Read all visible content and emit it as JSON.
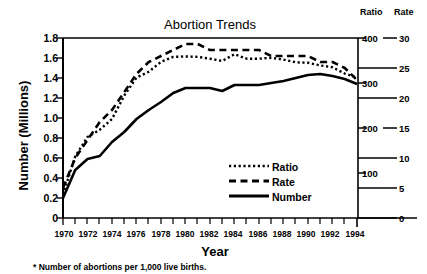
{
  "chart_data": {
    "type": "line",
    "title": "Abortion Trends",
    "xlabel": "Year",
    "ylabel": "Number (Millions)",
    "footnote": "* Number of abortions per 1,000 live births.",
    "grid": false,
    "legend_position": "inside-right-lower",
    "x": [
      1970,
      1971,
      1972,
      1973,
      1974,
      1975,
      1976,
      1977,
      1978,
      1979,
      1980,
      1981,
      1982,
      1983,
      1984,
      1985,
      1986,
      1987,
      1988,
      1989,
      1990,
      1991,
      1992,
      1993,
      1994
    ],
    "xlim": [
      1970,
      1994
    ],
    "xtick_labels": [
      "1970",
      "1972",
      "1974",
      "1976",
      "1978",
      "1980",
      "1982",
      "1984",
      "1986",
      "1988",
      "1990",
      "1992",
      "1994"
    ],
    "axes": [
      {
        "name": "left",
        "title": "Number (Millions)",
        "ylim": [
          0,
          1.8
        ],
        "ticks": [
          "1.8",
          "1.6",
          "1.4",
          "1.2",
          "1.0",
          "0.8",
          "0.6",
          "0.4",
          "0.2",
          "0"
        ],
        "tick_values": [
          1.8,
          1.6,
          1.4,
          1.2,
          1.0,
          0.8,
          0.6,
          0.4,
          0.2,
          0
        ]
      },
      {
        "name": "ratio",
        "title": "Ratio",
        "ylim": [
          0,
          400
        ],
        "ticks": [
          "400",
          "300",
          "200",
          "100"
        ],
        "tick_values": [
          400,
          300,
          200,
          100
        ]
      },
      {
        "name": "rate",
        "title": "Rate",
        "ylim": [
          0,
          30
        ],
        "ticks": [
          "30",
          "25",
          "20",
          "15",
          "10",
          "5",
          "0"
        ],
        "tick_values": [
          30,
          25,
          20,
          15,
          10,
          5,
          0
        ]
      }
    ],
    "series": [
      {
        "name": "Ratio",
        "style": "dotted",
        "axis": "ratio",
        "values": [
          52,
          137,
          180,
          196,
          220,
          272,
          312,
          325,
          347,
          358,
          359,
          358,
          354,
          349,
          364,
          354,
          354,
          356,
          352,
          346,
          345,
          339,
          335,
          321,
          312
        ]
      },
      {
        "name": "Rate",
        "style": "dashed",
        "axis": "rate",
        "values": [
          5,
          10,
          13,
          16,
          18,
          21,
          24,
          26,
          27,
          28,
          29,
          29,
          28,
          28,
          28,
          28,
          28,
          27,
          27,
          27,
          27,
          26,
          26,
          25,
          23
        ]
      },
      {
        "name": "Number",
        "style": "solid",
        "axis": "left",
        "values": [
          0.2,
          0.48,
          0.59,
          0.62,
          0.76,
          0.86,
          0.99,
          1.08,
          1.16,
          1.25,
          1.3,
          1.3,
          1.3,
          1.27,
          1.33,
          1.33,
          1.33,
          1.35,
          1.37,
          1.4,
          1.43,
          1.44,
          1.42,
          1.39,
          1.34
        ]
      }
    ],
    "legend": [
      {
        "label": "Ratio",
        "style": "dotted"
      },
      {
        "label": "Rate",
        "style": "dashed"
      },
      {
        "label": "Number",
        "style": "solid"
      }
    ]
  }
}
